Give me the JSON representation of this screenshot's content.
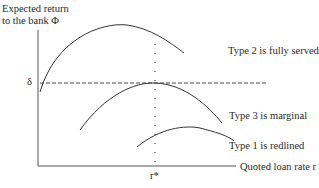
{
  "diagram": {
    "y_axis_label_line1": "Expected return",
    "y_axis_label_line2": "to the bank Φ",
    "x_axis_label": "Quoted loan rate r",
    "delta_label": "δ",
    "r_star_label": "r*",
    "curves": [
      {
        "id": "type2",
        "label": "Type 2 is fully served"
      },
      {
        "id": "type3",
        "label": "Type 3 is marginal"
      },
      {
        "id": "type1",
        "label": "Type 1 is redlined"
      }
    ],
    "colors": {
      "line": "#2a2a2a",
      "background": "#ffffff"
    }
  }
}
